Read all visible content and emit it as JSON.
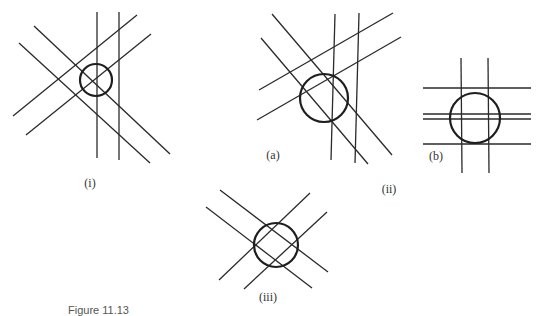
{
  "figure": {
    "caption": "Figure 11.13",
    "labels": {
      "i": "(i)",
      "a": "(a)",
      "ii": "(ii)",
      "b": "(b)",
      "iii": "(iii)"
    },
    "panels": [
      {
        "id": "i",
        "circle": {
          "cx": 96,
          "cy": 80,
          "r": 16
        },
        "lines": [
          [
            97,
            12,
            97,
            158
          ],
          [
            119,
            12,
            119,
            160
          ],
          [
            13,
            116,
            137,
            15
          ],
          [
            26,
            135,
            151,
            34
          ],
          [
            34,
            26,
            170,
            154
          ],
          [
            19,
            43,
            150,
            163
          ]
        ]
      },
      {
        "id": "ii",
        "circle": {
          "cx": 324,
          "cy": 98,
          "r": 24
        },
        "lines": [
          [
            335,
            14,
            331,
            160
          ],
          [
            359,
            13,
            355,
            163
          ],
          [
            259,
            90,
            393,
            13
          ],
          [
            257,
            120,
            401,
            37
          ],
          [
            272,
            14,
            392,
            155
          ],
          [
            261,
            38,
            368,
            164
          ]
        ]
      },
      {
        "id": "b",
        "circle": {
          "cx": 475,
          "cy": 118,
          "r": 25
        },
        "lines": [
          [
            461,
            58,
            462,
            173
          ],
          [
            488,
            58,
            489,
            173
          ],
          [
            423,
            88,
            531,
            88
          ],
          [
            423,
            114,
            531,
            114
          ],
          [
            423,
            119,
            531,
            119
          ],
          [
            423,
            144,
            531,
            144
          ]
        ]
      },
      {
        "id": "iii",
        "circle": {
          "cx": 276,
          "cy": 245,
          "r": 22
        },
        "lines": [
          [
            219,
            280,
            310,
            193
          ],
          [
            244,
            289,
            327,
            212
          ],
          [
            220,
            190,
            328,
            272
          ],
          [
            206,
            207,
            312,
            288
          ]
        ]
      }
    ]
  }
}
